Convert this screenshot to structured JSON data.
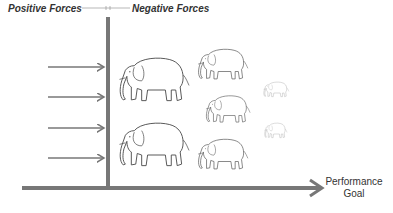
{
  "diagram": {
    "type": "force-field-analysis",
    "labels": {
      "positive": "Positive Forces",
      "negative": "Negative Forces",
      "goal_line1": "Performance",
      "goal_line2": "Goal"
    },
    "positive_arrows": 4,
    "elephants": [
      {
        "size": "large",
        "x": 118,
        "y": 52,
        "w": 74,
        "h": 53
      },
      {
        "size": "large",
        "x": 118,
        "y": 117,
        "w": 74,
        "h": 53
      },
      {
        "size": "medium",
        "x": 197,
        "y": 45,
        "w": 53,
        "h": 37
      },
      {
        "size": "medium",
        "x": 205,
        "y": 92,
        "w": 47,
        "h": 33
      },
      {
        "size": "medium",
        "x": 197,
        "y": 135,
        "w": 53,
        "h": 37
      },
      {
        "size": "small",
        "x": 263,
        "y": 80,
        "w": 27,
        "h": 18
      },
      {
        "size": "small",
        "x": 264,
        "y": 121,
        "w": 24,
        "h": 18
      }
    ],
    "colors": {
      "line": "#7a7a7a",
      "ink": "#555555",
      "text": "#333333"
    }
  }
}
